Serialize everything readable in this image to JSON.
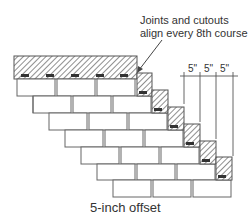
{
  "callout": {
    "line1": "Joints and cutouts",
    "line2": "align every 8th course"
  },
  "dimensions": {
    "labels": [
      "5\"",
      "5\"",
      "5\""
    ]
  },
  "caption": "5-inch offset",
  "colors": {
    "stroke": "#555555",
    "hatch": "#444444",
    "slot": "#333333",
    "text": "#333333"
  },
  "diagram": {
    "rows": 7,
    "shingles_per_row": 3,
    "offset_inches": 5
  }
}
